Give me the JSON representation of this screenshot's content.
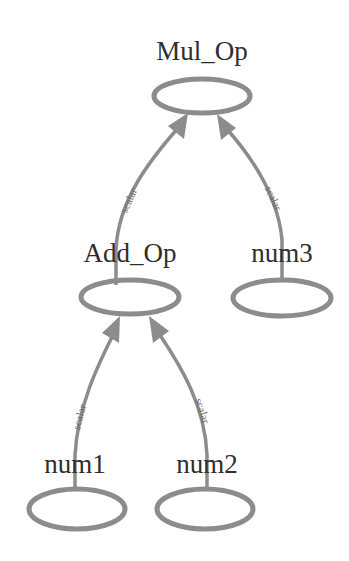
{
  "diagram": {
    "type": "expression-tree",
    "colors": {
      "stroke": "#8c8c8c",
      "text": "#2e2e2e",
      "edge_label": "#6a6a6a",
      "background": "#ffffff"
    },
    "nodes": [
      {
        "id": "mul_op",
        "label": "Mul_Op",
        "cx": 202,
        "cy": 96,
        "rx": 48,
        "ry": 17,
        "label_x": 202,
        "label_y": 60
      },
      {
        "id": "add_op",
        "label": "Add_Op",
        "cx": 130,
        "cy": 297,
        "rx": 49,
        "ry": 17,
        "label_x": 130,
        "label_y": 262
      },
      {
        "id": "num3",
        "label": "num3",
        "cx": 282,
        "cy": 298,
        "rx": 49,
        "ry": 18,
        "label_x": 282,
        "label_y": 262
      },
      {
        "id": "num1",
        "label": "num1",
        "cx": 77,
        "cy": 509,
        "rx": 48,
        "ry": 20,
        "label_x": 75,
        "label_y": 473
      },
      {
        "id": "num2",
        "label": "num2",
        "cx": 205,
        "cy": 509,
        "rx": 48,
        "ry": 20,
        "label_x": 207,
        "label_y": 473
      }
    ],
    "edges": [
      {
        "from": "add_op",
        "to": "mul_op",
        "label": "scalar"
      },
      {
        "from": "num3",
        "to": "mul_op",
        "label": "scalar"
      },
      {
        "from": "num1",
        "to": "add_op",
        "label": "scalar"
      },
      {
        "from": "num2",
        "to": "add_op",
        "label": "scalar"
      }
    ]
  }
}
